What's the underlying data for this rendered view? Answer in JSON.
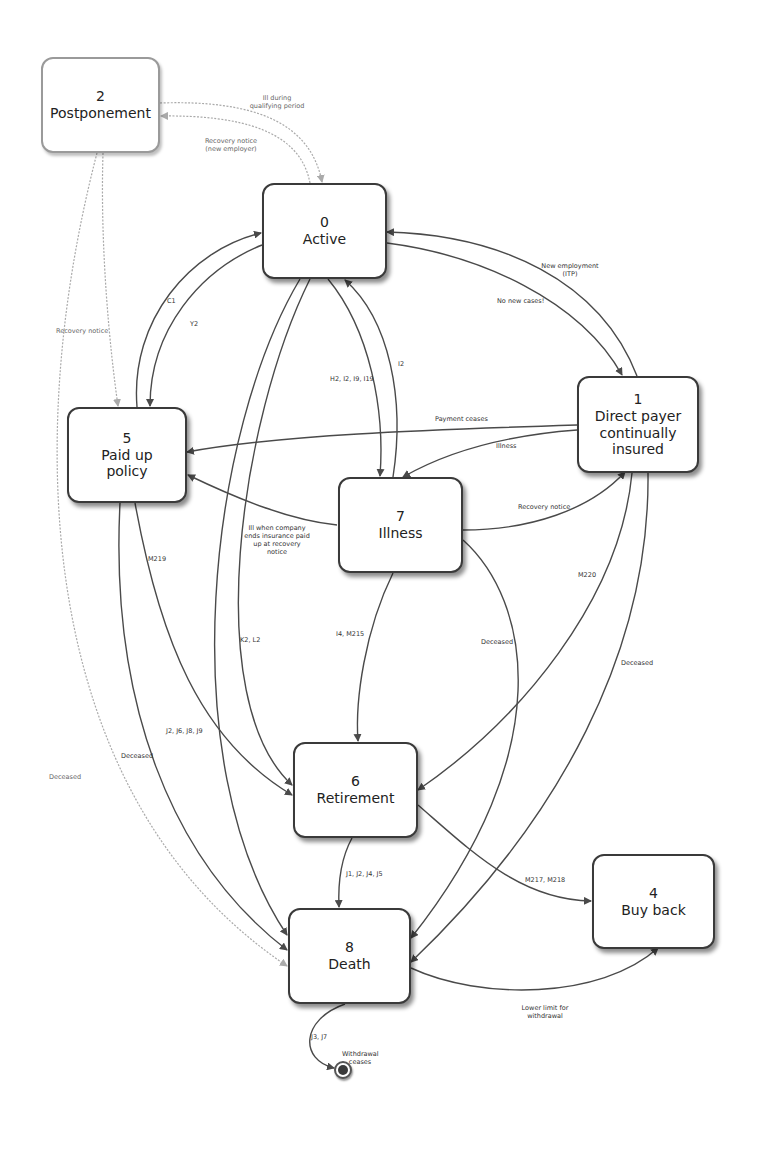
{
  "states": {
    "s0": {
      "num": "0",
      "name": "Active"
    },
    "s1": {
      "num": "1",
      "name": "Direct payer continually insured"
    },
    "s2": {
      "num": "2",
      "name": "Postponement"
    },
    "s4": {
      "num": "4",
      "name": "Buy back"
    },
    "s5": {
      "num": "5",
      "name": "Paid up policy"
    },
    "s6": {
      "num": "6",
      "name": "Retirement"
    },
    "s7": {
      "num": "7",
      "name": "Illness"
    },
    "s8": {
      "num": "8",
      "name": "Death"
    }
  },
  "transitions": {
    "t_2_0": "Ill during qualifying period",
    "t_0_2": "Recovery notice (new employer)",
    "t_2_5": "Recovery notice",
    "t_2_8": "Deceased",
    "t_5_0": "C1",
    "t_0_5": "Y2",
    "t_1_0": "New employment (ITP)",
    "t_0_1": "No new cases!",
    "t_0_7": "H2, I2, I9, I19",
    "t_7_0": "I2",
    "t_1_5": "Payment ceases",
    "t_1_7": "Illness",
    "t_7_1": "Recovery notice",
    "t_7_5": "Ill when company ends insurance paid up at recovery notice",
    "t_5_6": "M219",
    "t_0_6": "K2, L2",
    "t_7_6": "I4, M215",
    "t_7_8": "Deceased",
    "t_1_6": "M220",
    "t_1_8": "Deceased",
    "t_5_8_a": "J2, J6, J8, J9",
    "t_5_8_b": "Deceased",
    "t_6_8": "J1, J2, J4, J5",
    "t_6_4": "M217, M218",
    "t_8_4": "Lower limit for withdrawal",
    "t_8_end": "J3, J7",
    "end_label": "Withdrawal ceases"
  },
  "colors": {
    "line": "#4a4a4a",
    "light_line": "#aaaaaa",
    "node_border": "#3a3a3a",
    "background": "#ffffff"
  }
}
